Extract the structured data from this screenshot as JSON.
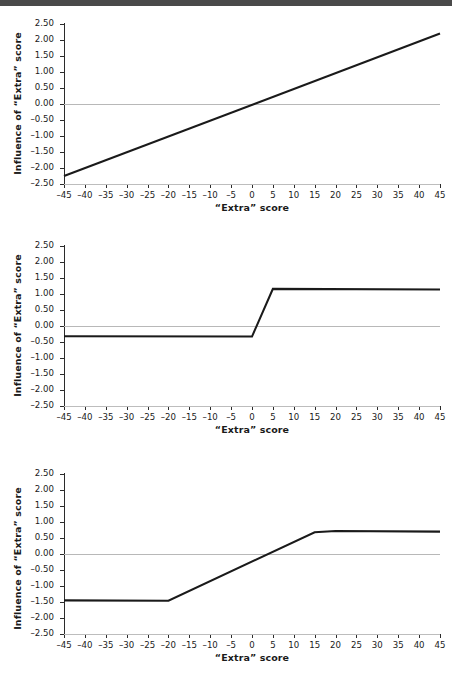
{
  "figure": {
    "scan_bar_color": "#4a4a4a",
    "background": "#ffffff",
    "line_color": "#1a1a1a",
    "zero_line_color": "#b8b8b8",
    "axis_color": "#2b2b2b"
  },
  "axis": {
    "xlabel": "“Extra” score",
    "ylabel": "Influence of “Extra” score",
    "xticks": [
      -45,
      -40,
      -35,
      -30,
      -25,
      -20,
      -15,
      -10,
      -5,
      0,
      5,
      10,
      15,
      20,
      25,
      30,
      35,
      40,
      45
    ],
    "xtick_labels": [
      "–45",
      "–40",
      "–35",
      "–30",
      "–25",
      "–20",
      "–15",
      "–10",
      "–5",
      "0",
      "5",
      "10",
      "15",
      "20",
      "25",
      "30",
      "35",
      "40",
      "45"
    ],
    "yticks": [
      2.5,
      2.0,
      1.5,
      1.0,
      0.5,
      0.0,
      -0.5,
      -1.0,
      -1.5,
      -2.0,
      -2.5
    ],
    "ytick_labels": [
      "2.50",
      "2.00",
      "1.50",
      "1.00",
      "0.50",
      "0.00",
      "–0.50",
      "–1.00",
      "–1.50",
      "–2.00",
      "–2.50"
    ],
    "xlim": [
      -45,
      45
    ],
    "ylim": [
      -2.5,
      2.5
    ]
  },
  "chart_data": [
    {
      "type": "line",
      "title": "",
      "xlabel": "“Extra” score",
      "ylabel": "Influence of “Extra” score",
      "xlim": [
        -45,
        45
      ],
      "ylim": [
        -2.5,
        2.5
      ],
      "grid": false,
      "legend": "none",
      "annotations": [
        "linear increasing influence across full range"
      ],
      "series": [
        {
          "name": "linear",
          "x": [
            -45,
            45
          ],
          "values": [
            -2.25,
            2.2
          ]
        }
      ],
      "reference_lines": [
        {
          "y": 0.0,
          "style": "solid-gray"
        }
      ]
    },
    {
      "type": "line",
      "title": "",
      "xlabel": "“Extra” score",
      "ylabel": "Influence of “Extra” score",
      "xlim": [
        -45,
        45
      ],
      "ylim": [
        -2.5,
        2.5
      ],
      "grid": false,
      "legend": "none",
      "annotations": [
        "flat at –0.32 up to x=0, steep rise, plateau at 1.16 from x=5"
      ],
      "series": [
        {
          "name": "piecewise-step",
          "x": [
            -45,
            0,
            5,
            45
          ],
          "values": [
            -0.32,
            -0.33,
            1.16,
            1.14
          ]
        }
      ],
      "reference_lines": [
        {
          "y": 0.0,
          "style": "solid-gray"
        }
      ]
    },
    {
      "type": "line",
      "title": "",
      "xlabel": "“Extra” score",
      "ylabel": "Influence of “Extra” score",
      "xlim": [
        -45,
        45
      ],
      "ylim": [
        -2.5,
        2.5
      ],
      "grid": false,
      "legend": "none",
      "annotations": [
        "flat at –1.45 up to x=–20, linear rise, plateau at 0.70 from x=15"
      ],
      "series": [
        {
          "name": "piecewise-ramp",
          "x": [
            -45,
            -20,
            15,
            20,
            45
          ],
          "values": [
            -1.45,
            -1.46,
            0.68,
            0.72,
            0.7
          ]
        }
      ],
      "reference_lines": [
        {
          "y": 0.0,
          "style": "solid-gray"
        }
      ]
    }
  ]
}
